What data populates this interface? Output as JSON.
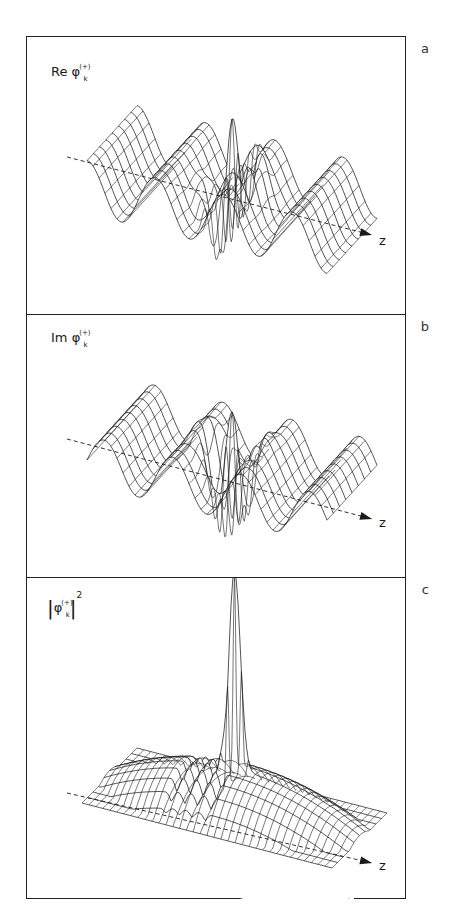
{
  "figure": {
    "panels": [
      {
        "letter": "a",
        "label_prefix": "Re ",
        "label_symbol": "φ",
        "label_sup": "(+)",
        "label_sub": "k",
        "axis_label": "z",
        "top": 0,
        "height": 277
      },
      {
        "letter": "b",
        "label_prefix": "Im ",
        "label_symbol": "φ",
        "label_sup": "(+)",
        "label_sub": "k",
        "axis_label": "z",
        "top": 277,
        "height": 263
      },
      {
        "letter": "c",
        "label_prefix": "",
        "label_symbol": "φ",
        "label_sup": "(+)",
        "label_sub": "k",
        "label_power": "2",
        "axis_label": "z",
        "top": 540,
        "height": 323
      }
    ]
  },
  "chart_data": [
    {
      "type": "surface",
      "title": "Re φ_k^(+)",
      "panel": "a",
      "axis_labels": [
        "z"
      ],
      "description": "3D wireframe of real part of scattering wavefunction; oscillatory plane-wave ripples with a sharp central spike near the scattering center"
    },
    {
      "type": "surface",
      "title": "Im φ_k^(+)",
      "panel": "b",
      "axis_labels": [
        "z"
      ],
      "description": "3D wireframe of imaginary part of scattering wavefunction; oscillatory ripples with a central spike"
    },
    {
      "type": "surface",
      "title": "|φ_k^(+)|^2",
      "panel": "c",
      "axis_labels": [
        "z"
      ],
      "description": "3D wireframe of probability density; dome-shaped envelope with tall narrow central peak and shadow region behind the scatterer"
    }
  ]
}
